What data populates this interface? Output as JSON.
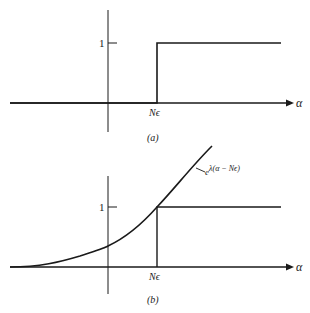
{
  "panel_a": {
    "caption": "(a)",
    "y_tick_label": "1",
    "x_marker_label": "Nϵ",
    "x_axis_label": "α",
    "curve": "unit step at Nϵ"
  },
  "panel_b": {
    "caption": "(b)",
    "y_tick_label": "1",
    "x_marker_label": "Nϵ",
    "x_axis_label": "α",
    "curve_label_base": "e",
    "curve_label_exponent": "λ(α − Nϵ)",
    "curves": [
      "unit step at Nϵ",
      "exponential e^{λ(α−Nϵ)} bounding step"
    ]
  },
  "colors": {
    "ink": "#1a1a1a",
    "background": "#ffffff"
  }
}
